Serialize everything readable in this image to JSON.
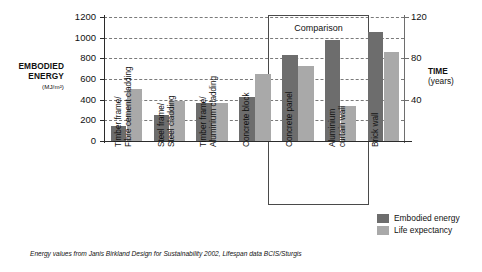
{
  "chart_data": {
    "type": "bar",
    "title": "",
    "categories": [
      "Timber frame/ Fibre cement cladding",
      "Steel frame/ Steel cladding",
      "Timber frame/ Aluminium cladding",
      "Concrete block",
      "Concrete panel",
      "Aluminium curtain wall",
      "Brick wall"
    ],
    "category_lines": [
      [
        "Timber frame/",
        "Fibre cement cladding"
      ],
      [
        "Steel frame/",
        "Steel cladding"
      ],
      [
        "Timber frame/",
        "Aluminium cladding"
      ],
      [
        "Concrete block",
        ""
      ],
      [
        "Concrete panel",
        ""
      ],
      [
        "Aluminium",
        "curtain wall"
      ],
      [
        "Brick wall",
        ""
      ]
    ],
    "series": [
      {
        "name": "Embodied energy",
        "color": "#6d6d6d",
        "axis": "left",
        "values": [
          150,
          255,
          370,
          425,
          830,
          980,
          1055
        ]
      },
      {
        "name": "Life expectancy",
        "color": "#a9a9a9",
        "axis": "right",
        "values": [
          50,
          39,
          37,
          65,
          73,
          34,
          86
        ]
      }
    ],
    "ylabel": "EMBODIED ENERGY",
    "yunits": "(MJ/m²)",
    "ylim": [
      0,
      1200
    ],
    "yticks": [
      0,
      200,
      400,
      600,
      800,
      1000,
      1200
    ],
    "ytick_labels": [
      "0",
      "200",
      "400",
      "600",
      "800",
      "1000",
      "1200"
    ],
    "y2label": "TIME",
    "y2units": "(years)",
    "y2lim": [
      0,
      120
    ],
    "y2ticks": [
      40,
      80,
      120
    ],
    "y2tick_labels": [
      "40",
      "80",
      "120"
    ],
    "xlabel": "",
    "grid": true,
    "legend_position": "bottom-right",
    "annotations": [
      {
        "name": "comparison",
        "text": "Comparison",
        "covers": [
          "Concrete panel",
          "Aluminium curtain wall"
        ]
      }
    ],
    "footnote": "Energy values from Janis Birkland Design for Sustainability 2002, Lifespan data BCIS/Sturgis"
  },
  "legend": {
    "items": [
      {
        "label": "Embodied energy",
        "color": "#6d6d6d"
      },
      {
        "label": "Life expectancy",
        "color": "#a9a9a9"
      }
    ]
  }
}
